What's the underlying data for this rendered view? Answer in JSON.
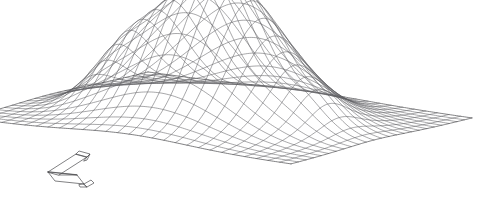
{
  "figure": {
    "title": "",
    "background_color": "#ffffff",
    "line_color": "#5f5f63",
    "edge_color": "#4a4a4e",
    "line_width": 0.55,
    "width_px": 496,
    "height_px": 215
  },
  "chart_data": {
    "type": "surface",
    "render_style": "wireframe-mesh",
    "title": "",
    "xlabel": "",
    "ylabel": "",
    "zlabel": "",
    "grid": false,
    "legend": false,
    "axes_visible": false,
    "tick_labels": [],
    "annotations": [],
    "surface_function": "gaussian-bump",
    "nx": 28,
    "ny": 24,
    "xlim": [
      -3,
      3
    ],
    "ylim": [
      -3,
      3
    ],
    "zlim": [
      0,
      1
    ],
    "peak": {
      "x": 0.0,
      "y": 0.15,
      "z": 1.0
    },
    "sigma_x": 1.05,
    "sigma_y": 1.15,
    "secondary_bumps": [
      {
        "x": -1.55,
        "y": 0.45,
        "z": 0.18,
        "sx": 0.45,
        "sy": 0.6
      },
      {
        "x": 1.85,
        "y": 0.25,
        "z": 0.12,
        "sx": 0.42,
        "sy": 0.55
      }
    ],
    "projection": {
      "type": "oblique-isometric",
      "azimuth_deg": -37,
      "elevation_deg": 22,
      "z_scale": 148
    },
    "plot_corners_px": {
      "left": [
        45,
        100
      ],
      "back": [
        148,
        72
      ],
      "right": [
        472,
        118
      ],
      "front": [
        291,
        164
      ]
    }
  },
  "overlays": {
    "axis_triad": {
      "name": "axis-triad-glyph",
      "position_px": [
        46,
        151
      ],
      "size_px": [
        50,
        36
      ],
      "axes": [
        "x",
        "y",
        "z"
      ],
      "labels": []
    }
  }
}
